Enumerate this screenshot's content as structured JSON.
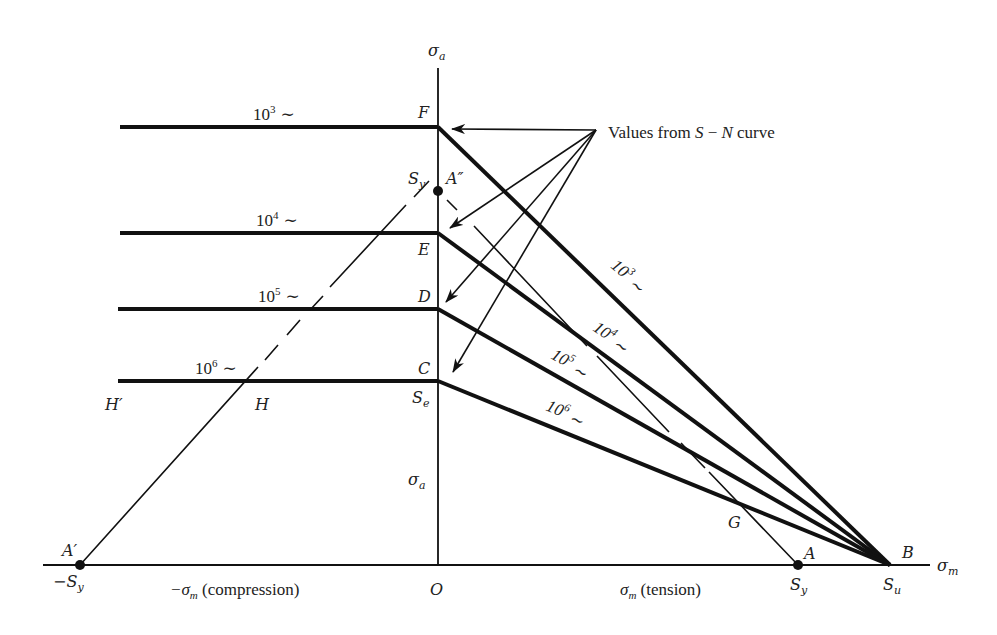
{
  "diagram": {
    "axes": {
      "vertical_label": "σ",
      "vertical_sub": "a",
      "horizontal_label": "σ",
      "horizontal_sub": "m",
      "origin_label": "O",
      "compression_label_prefix": "−σ",
      "compression_label_sub": "m",
      "compression_label_suffix": " (compression)",
      "tension_label_prefix": "σ",
      "tension_label_sub": "m",
      "tension_label_suffix": " (tension)",
      "inner_sigma_a_label": "σ",
      "inner_sigma_a_sub": "a"
    },
    "points": {
      "F": "F",
      "E": "E",
      "D": "D",
      "C": "C",
      "Se": "S",
      "Se_sub": "e",
      "A_double_prime": "A″",
      "Sy_top": "S",
      "Sy_top_sub": "y",
      "A_prime": "A′",
      "neg_Sy": "−S",
      "neg_Sy_sub": "y",
      "A": "A",
      "Sy_right": "S",
      "Sy_right_sub": "y",
      "B": "B",
      "Su": "S",
      "Su_sub": "u",
      "G": "G",
      "H": "H",
      "H_prime": "H′"
    },
    "life_lines": [
      {
        "id": "1e3",
        "base": "10",
        "exp": "3",
        "tilde": "∼",
        "point": "F"
      },
      {
        "id": "1e4",
        "base": "10",
        "exp": "4",
        "tilde": "∼",
        "point": "E"
      },
      {
        "id": "1e5",
        "base": "10",
        "exp": "5",
        "tilde": "∼",
        "point": "D"
      },
      {
        "id": "1e6",
        "base": "10",
        "exp": "6",
        "tilde": "∼",
        "point": "C"
      }
    ],
    "annotation": {
      "prefix": "Values from ",
      "S": "S",
      "dash": " − ",
      "N": "N",
      "suffix": " curve"
    }
  }
}
